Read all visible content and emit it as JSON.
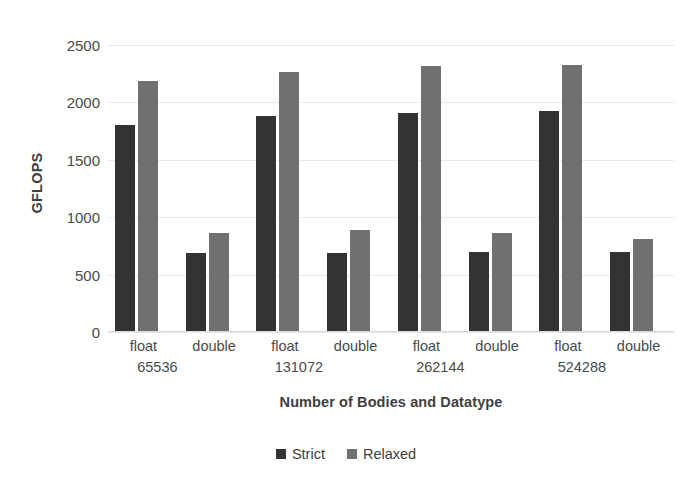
{
  "chart_data": {
    "type": "bar",
    "title": "",
    "xlabel": "Number of Bodies and Datatype",
    "ylabel": "GFLOPS",
    "ylim": [
      0,
      2500
    ],
    "yticks": [
      0,
      500,
      1000,
      1500,
      2000,
      2500
    ],
    "ytick_labels": [
      "0",
      "500",
      "1000",
      "1500",
      "2000",
      "2500"
    ],
    "grid": true,
    "legend_position": "bottom",
    "categories": [
      "float 65536",
      "double 65536",
      "float 131072",
      "double 131072",
      "float 262144",
      "double 262144",
      "float 524288",
      "double 524288"
    ],
    "category_labels": [
      {
        "type": "float",
        "size": "65536"
      },
      {
        "type": "double",
        "size": ""
      },
      {
        "type": "float",
        "size": "131072"
      },
      {
        "type": "double",
        "size": ""
      },
      {
        "type": "float",
        "size": "262144"
      },
      {
        "type": "double",
        "size": ""
      },
      {
        "type": "float",
        "size": "524288"
      },
      {
        "type": "double",
        "size": ""
      }
    ],
    "series": [
      {
        "name": "Strict",
        "color": "#333333",
        "values": [
          1800,
          685,
          1885,
          685,
          1910,
          695,
          1925,
          695
        ]
      },
      {
        "name": "Relaxed",
        "color": "#707070",
        "values": [
          2190,
          860,
          2265,
          885,
          2315,
          865,
          2325,
          810
        ]
      }
    ]
  },
  "axes": {
    "y_title": "GFLOPS",
    "x_title": "Number of Bodies and Datatype"
  },
  "legend": {
    "items": [
      {
        "label": "Strict",
        "color": "#333333"
      },
      {
        "label": "Relaxed",
        "color": "#707070"
      }
    ]
  },
  "colors": {
    "strict": "#333333",
    "relaxed": "#707070",
    "gridline": "#e8e8e8",
    "text": "#4a4a4a",
    "title_text": "#404040",
    "background": "#ffffff"
  }
}
